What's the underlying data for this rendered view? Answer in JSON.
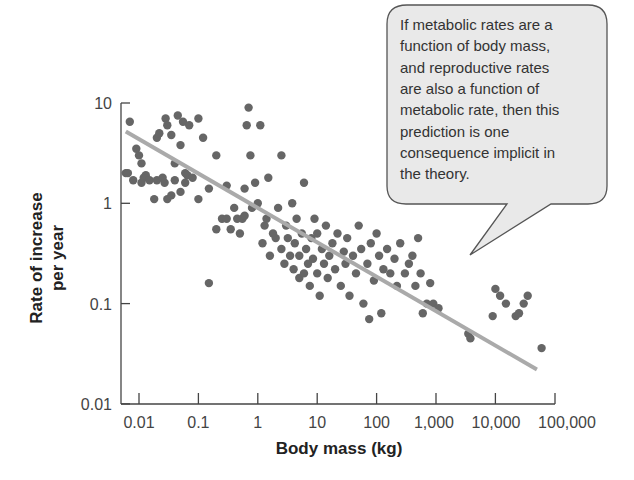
{
  "chart_data": {
    "type": "scatter",
    "title": "",
    "xlabel": "Body mass (kg)",
    "ylabel": [
      "Rate of increase",
      "per year"
    ],
    "xscale": "log",
    "yscale": "log",
    "xlim": [
      0.005,
      100000
    ],
    "ylim": [
      0.01,
      10
    ],
    "x_ticks": [
      0.01,
      0.1,
      1,
      10,
      100,
      1000,
      10000,
      100000
    ],
    "x_tick_labels": [
      "0.01",
      "0.1",
      "1",
      "10",
      "100",
      "1,000",
      "10,000",
      "100,000"
    ],
    "y_ticks": [
      10,
      1,
      0.1,
      0.01
    ],
    "y_tick_labels": [
      "10",
      "1",
      "0.1",
      "0.01"
    ],
    "grid": false,
    "legend": null,
    "marker_color": "#666666",
    "regression_line": {
      "color": "#aaaaaa",
      "x": [
        0.006,
        50000
      ],
      "y": [
        5.2,
        0.022
      ]
    },
    "points": [
      [
        0.007,
        6.5
      ],
      [
        0.006,
        2.0
      ],
      [
        0.0065,
        2.0
      ],
      [
        0.008,
        1.7
      ],
      [
        0.009,
        3.5
      ],
      [
        0.01,
        3.0
      ],
      [
        0.011,
        2.5
      ],
      [
        0.011,
        1.6
      ],
      [
        0.012,
        1.8
      ],
      [
        0.013,
        1.9
      ],
      [
        0.015,
        1.7
      ],
      [
        0.018,
        1.1
      ],
      [
        0.02,
        1.7
      ],
      [
        0.02,
        4.5
      ],
      [
        0.022,
        5.0
      ],
      [
        0.025,
        1.8
      ],
      [
        0.027,
        1.6
      ],
      [
        0.028,
        7.0
      ],
      [
        0.03,
        6.0
      ],
      [
        0.03,
        1.1
      ],
      [
        0.035,
        1.2
      ],
      [
        0.035,
        4.8
      ],
      [
        0.04,
        2.5
      ],
      [
        0.04,
        1.7
      ],
      [
        0.045,
        7.5
      ],
      [
        0.05,
        1.3
      ],
      [
        0.05,
        3.8
      ],
      [
        0.055,
        6.5
      ],
      [
        0.06,
        2.0
      ],
      [
        0.06,
        1.6
      ],
      [
        0.065,
        1.9
      ],
      [
        0.07,
        6.0
      ],
      [
        0.08,
        1.8
      ],
      [
        0.1,
        7.0
      ],
      [
        0.1,
        1.1
      ],
      [
        0.12,
        4.5
      ],
      [
        0.15,
        1.4
      ],
      [
        0.15,
        0.16
      ],
      [
        0.2,
        0.55
      ],
      [
        0.2,
        3.0
      ],
      [
        0.25,
        0.7
      ],
      [
        0.3,
        1.5
      ],
      [
        0.3,
        0.7
      ],
      [
        0.35,
        0.55
      ],
      [
        0.4,
        0.9
      ],
      [
        0.45,
        0.7
      ],
      [
        0.5,
        0.5
      ],
      [
        0.55,
        0.7
      ],
      [
        0.6,
        1.4
      ],
      [
        0.6,
        0.75
      ],
      [
        0.65,
        6.0
      ],
      [
        0.7,
        9.0
      ],
      [
        0.75,
        3.0
      ],
      [
        0.8,
        0.9
      ],
      [
        0.9,
        1.6
      ],
      [
        1.0,
        1.0
      ],
      [
        1.1,
        6.0
      ],
      [
        1.2,
        0.4
      ],
      [
        1.3,
        0.6
      ],
      [
        1.4,
        0.7
      ],
      [
        1.5,
        1.8
      ],
      [
        1.6,
        0.3
      ],
      [
        1.8,
        0.5
      ],
      [
        2.0,
        0.45
      ],
      [
        2.2,
        0.9
      ],
      [
        2.5,
        3.0
      ],
      [
        2.5,
        0.35
      ],
      [
        2.8,
        0.25
      ],
      [
        3.0,
        0.6
      ],
      [
        3.2,
        0.45
      ],
      [
        3.5,
        0.3
      ],
      [
        3.8,
        1.0
      ],
      [
        4.0,
        0.22
      ],
      [
        4.2,
        0.4
      ],
      [
        4.5,
        0.7
      ],
      [
        5.0,
        0.18
      ],
      [
        5.0,
        0.3
      ],
      [
        5.5,
        0.5
      ],
      [
        6.0,
        1.6
      ],
      [
        6.0,
        0.2
      ],
      [
        6.5,
        0.35
      ],
      [
        7.0,
        0.25
      ],
      [
        7.5,
        0.15
      ],
      [
        8.0,
        0.45
      ],
      [
        8.5,
        0.28
      ],
      [
        9.0,
        0.7
      ],
      [
        10,
        0.2
      ],
      [
        10,
        0.5
      ],
      [
        11,
        0.12
      ],
      [
        12,
        0.35
      ],
      [
        13,
        0.25
      ],
      [
        14,
        0.6
      ],
      [
        15,
        0.18
      ],
      [
        16,
        0.3
      ],
      [
        18,
        0.4
      ],
      [
        20,
        0.22
      ],
      [
        22,
        0.5
      ],
      [
        25,
        0.15
      ],
      [
        28,
        0.33
      ],
      [
        30,
        0.25
      ],
      [
        32,
        0.45
      ],
      [
        35,
        0.12
      ],
      [
        40,
        0.3
      ],
      [
        45,
        0.2
      ],
      [
        50,
        0.6
      ],
      [
        55,
        0.35
      ],
      [
        60,
        0.1
      ],
      [
        70,
        0.25
      ],
      [
        75,
        0.07
      ],
      [
        80,
        0.4
      ],
      [
        90,
        0.17
      ],
      [
        100,
        0.5
      ],
      [
        110,
        0.3
      ],
      [
        120,
        0.08
      ],
      [
        130,
        0.22
      ],
      [
        150,
        0.35
      ],
      [
        170,
        0.2
      ],
      [
        200,
        0.28
      ],
      [
        220,
        0.15
      ],
      [
        250,
        0.4
      ],
      [
        300,
        0.2
      ],
      [
        350,
        0.25
      ],
      [
        400,
        0.3
      ],
      [
        450,
        0.15
      ],
      [
        500,
        0.45
      ],
      [
        550,
        0.2
      ],
      [
        600,
        0.08
      ],
      [
        700,
        0.1
      ],
      [
        800,
        0.16
      ],
      [
        900,
        0.1
      ],
      [
        1100,
        0.09
      ],
      [
        3500,
        0.05
      ],
      [
        3800,
        0.045
      ],
      [
        9000,
        0.075
      ],
      [
        10000,
        0.14
      ],
      [
        12000,
        0.12
      ],
      [
        15000,
        0.1
      ],
      [
        22000,
        0.075
      ],
      [
        25000,
        0.08
      ],
      [
        30000,
        0.1
      ],
      [
        35000,
        0.12
      ],
      [
        60000,
        0.036
      ]
    ],
    "annotation": {
      "lines": [
        "If metabolic rates are a",
        "function of body mass,",
        "and reproductive rates",
        "are also a function of",
        "metabolic rate, then this",
        "prediction is one",
        "consequence implicit in",
        "the theory."
      ],
      "fill": "#e9e9e9",
      "stroke": "#555555"
    }
  }
}
